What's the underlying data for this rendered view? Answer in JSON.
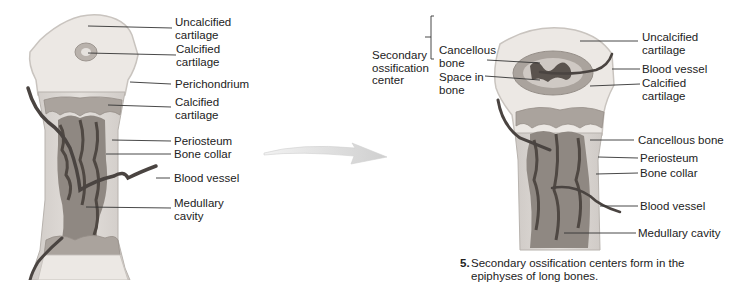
{
  "left_panel": {
    "labels": [
      {
        "id": "uncalcified-cartilage",
        "text": "Uncalcified\ncartilage"
      },
      {
        "id": "calcified-cartilage-center",
        "text": "Calcified\ncartilage"
      },
      {
        "id": "perichondrium",
        "text": "Perichondrium"
      },
      {
        "id": "calcified-cartilage",
        "text": "Calcified\ncartilage"
      },
      {
        "id": "periosteum",
        "text": "Periosteum"
      },
      {
        "id": "bone-collar",
        "text": "Bone collar"
      },
      {
        "id": "blood-vessel",
        "text": "Blood vessel"
      },
      {
        "id": "medullary-cavity",
        "text": "Medullary\ncavity"
      }
    ]
  },
  "right_panel": {
    "group_label": "Secondary\nossification\ncenter",
    "group_items": [
      {
        "id": "cancellous-bone-group",
        "text": "Cancellous\nbone"
      },
      {
        "id": "space-in-bone",
        "text": "Space in\nbone"
      }
    ],
    "labels": [
      {
        "id": "uncalcified-cartilage",
        "text": "Uncalcified\ncartilage"
      },
      {
        "id": "blood-vessel-top",
        "text": "Blood vessel"
      },
      {
        "id": "calcified-cartilage",
        "text": "Calcified\ncartilage"
      },
      {
        "id": "cancellous-bone",
        "text": "Cancellous bone"
      },
      {
        "id": "periosteum",
        "text": "Periosteum"
      },
      {
        "id": "bone-collar",
        "text": "Bone collar"
      },
      {
        "id": "blood-vessel-bottom",
        "text": "Blood vessel"
      },
      {
        "id": "medullary-cavity",
        "text": "Medullary cavity"
      }
    ]
  },
  "caption": {
    "number": "5.",
    "text": "Secondary ossification centers form in the epiphyses of long bones."
  },
  "colors": {
    "cartilage": "#ece8e4",
    "cartilage_edge": "#c9c4bf",
    "calcified": "#a9a29d",
    "shaft": "#d4cfcb",
    "marrow": "#8f8882",
    "spongy": "#5a534e",
    "vessel": "#4a4441",
    "leader": "#333333",
    "arrow": "#d9d9d9"
  }
}
